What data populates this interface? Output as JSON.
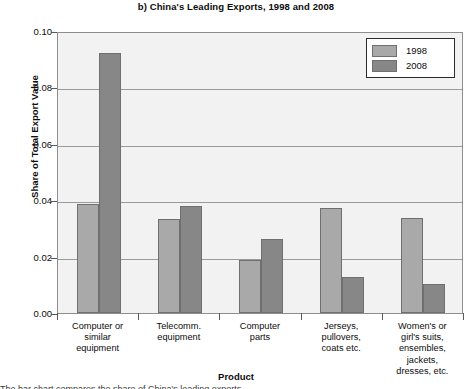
{
  "chart_data": {
    "type": "bar",
    "title": "b) China's Leading Exports, 1998 and 2008",
    "xlabel": "Product",
    "ylabel": "Share of Total Export Value",
    "categories": [
      "Computer or\nsimilar\nequipment",
      "Telecomm.\nequipment",
      "Computer\nparts",
      "Jerseys,\npullovers,\ncoats etc.",
      "Women's or\ngirl's suits,\nensembles,\njackets,\ndresses, etc."
    ],
    "category_lines": [
      [
        "Computer or",
        "similar",
        "equipment"
      ],
      [
        "Telecomm.",
        "equipment"
      ],
      [
        "Computer",
        "parts"
      ],
      [
        "Jerseys,",
        "pullovers,",
        "coats etc."
      ],
      [
        "Women's or",
        "girl's suits,",
        "ensembles,",
        "jackets,",
        "dresses, etc."
      ]
    ],
    "series": [
      {
        "name": "1998",
        "color": "#a9a9a9",
        "values": [
          0.0386,
          0.0335,
          0.0187,
          0.0372,
          0.0336
        ]
      },
      {
        "name": "2008",
        "color": "#878787",
        "values": [
          0.0922,
          0.0381,
          0.0262,
          0.0128,
          0.0104
        ]
      }
    ],
    "ylim": [
      0.0,
      0.1
    ],
    "yticks": [
      0.0,
      0.02,
      0.04,
      0.06,
      0.08,
      0.1
    ],
    "ytick_labels": [
      "0.00",
      "0.02",
      "0.04",
      "0.06",
      "0.08",
      "0.10"
    ],
    "grid": true,
    "legend_position": "top-right",
    "legend_entries": [
      "1998",
      "2008"
    ],
    "plot_background": "#f2f2f2"
  },
  "bottom_caption": "The bar chart compares the share of China's leading exports."
}
